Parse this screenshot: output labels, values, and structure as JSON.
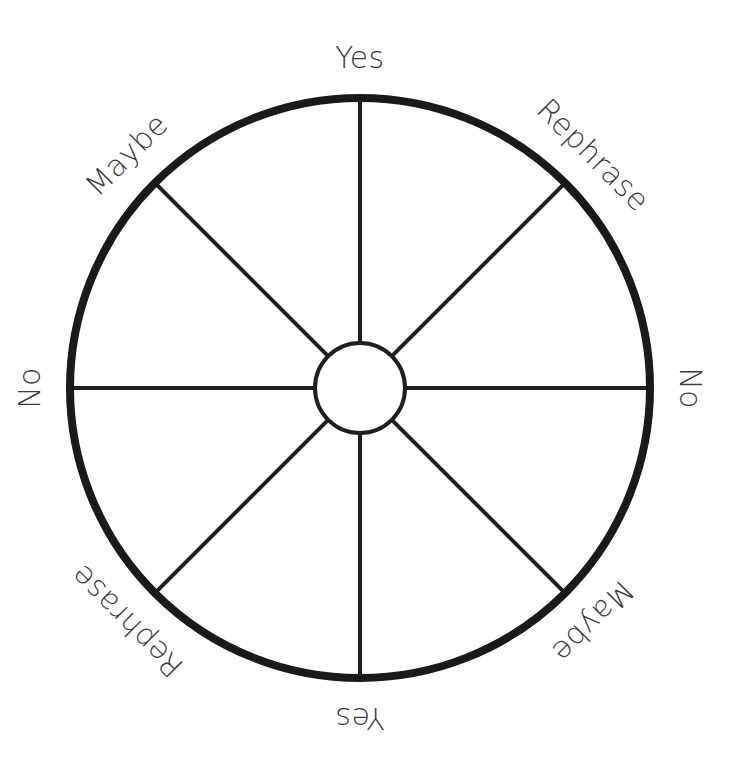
{
  "page": {
    "background_color": "#ffffff",
    "width": 745,
    "height": 772
  },
  "wheel": {
    "name": "eight-segment-spinner",
    "center_x": 360,
    "center_y": 388,
    "outer_radius": 290,
    "hub_radius": 45,
    "rim_color": "#1a1a1a",
    "rim_width": 8,
    "spoke_color": "#1f1f1f",
    "spoke_width": 4,
    "hub_color": "#1f1f1f",
    "hub_width": 4,
    "segment_count": 8,
    "label_color": "#3b3b3b",
    "label_font_size": 30,
    "label_radius": 330,
    "segments": [
      {
        "label": "Yes",
        "angle_deg": 0,
        "text_rotation_deg": 0
      },
      {
        "label": "Rephrase",
        "angle_deg": 45,
        "text_rotation_deg": 45
      },
      {
        "label": "No",
        "angle_deg": 90,
        "text_rotation_deg": 90
      },
      {
        "label": "Maybe",
        "angle_deg": 135,
        "text_rotation_deg": 135
      },
      {
        "label": "Yes",
        "angle_deg": 180,
        "text_rotation_deg": 180
      },
      {
        "label": "Rephrase",
        "angle_deg": 225,
        "text_rotation_deg": 225
      },
      {
        "label": "No",
        "angle_deg": 270,
        "text_rotation_deg": 270
      },
      {
        "label": "Maybe",
        "angle_deg": 315,
        "text_rotation_deg": 315
      }
    ],
    "spokes": [
      {
        "name": "spoke-up",
        "angle_deg": 0
      },
      {
        "name": "spoke-upper-right",
        "angle_deg": 45
      },
      {
        "name": "spoke-right",
        "angle_deg": 90
      },
      {
        "name": "spoke-lower-right",
        "angle_deg": 135
      },
      {
        "name": "spoke-down",
        "angle_deg": 180
      },
      {
        "name": "spoke-lower-left",
        "angle_deg": 225
      },
      {
        "name": "spoke-left",
        "angle_deg": 270
      },
      {
        "name": "spoke-upper-left",
        "angle_deg": 315
      }
    ]
  },
  "chart_data": {
    "type": "pie",
    "categories": [
      "Yes",
      "Rephrase",
      "No",
      "Maybe",
      "Yes",
      "Rephrase",
      "No",
      "Maybe"
    ],
    "values": [
      12.5,
      12.5,
      12.5,
      12.5,
      12.5,
      12.5,
      12.5,
      12.5
    ],
    "unit": "percent",
    "legend": "none",
    "grid": false,
    "xlabel": "",
    "ylabel": ""
  }
}
